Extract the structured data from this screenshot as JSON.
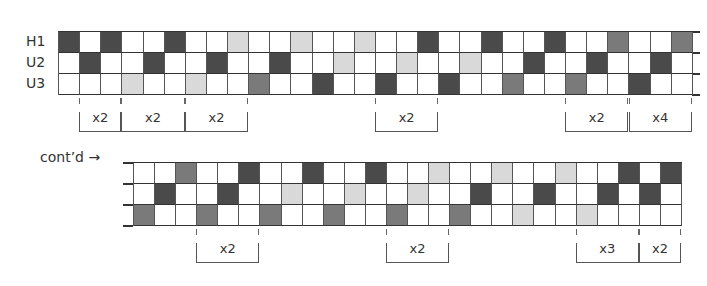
{
  "figure": {
    "row_labels": [
      "H1",
      "U2",
      "U3"
    ],
    "continued_label": "cont’d",
    "continued_arrow": "→",
    "legend_codes": {
      "0": "white",
      "1": "light gray",
      "2": "medium gray",
      "3": "dark gray"
    },
    "colors": {
      "white": "#ffffff",
      "light": "#d9d9d9",
      "medium": "#7a7a7a",
      "dark": "#4a4a4a"
    },
    "section1": {
      "columns": 30,
      "rows": [
        [
          3,
          0,
          3,
          0,
          0,
          3,
          0,
          0,
          1,
          0,
          0,
          1,
          0,
          0,
          1,
          0,
          0,
          3,
          0,
          0,
          3,
          0,
          0,
          3,
          0,
          0,
          2,
          0,
          0,
          2
        ],
        [
          0,
          3,
          0,
          0,
          3,
          0,
          0,
          3,
          0,
          0,
          3,
          0,
          0,
          1,
          0,
          0,
          1,
          0,
          0,
          1,
          0,
          0,
          3,
          0,
          0,
          3,
          0,
          0,
          3,
          0
        ],
        [
          0,
          0,
          0,
          1,
          0,
          0,
          1,
          0,
          0,
          2,
          0,
          0,
          3,
          0,
          0,
          3,
          0,
          0,
          3,
          0,
          0,
          2,
          0,
          0,
          2,
          0,
          0,
          3,
          0,
          0
        ]
      ],
      "brackets": [
        {
          "start_col": 1,
          "end_col": 3,
          "label": "x2"
        },
        {
          "start_col": 3,
          "end_col": 6,
          "label": "x2"
        },
        {
          "start_col": 6,
          "end_col": 9,
          "label": "x2"
        },
        {
          "start_col": 15,
          "end_col": 18,
          "label": "x2"
        },
        {
          "start_col": 24,
          "end_col": 27,
          "label": "x2"
        },
        {
          "start_col": 27,
          "end_col": 30,
          "label": "x4"
        }
      ]
    },
    "section2": {
      "columns": 26,
      "rows": [
        [
          0,
          0,
          2,
          0,
          0,
          3,
          0,
          0,
          3,
          0,
          0,
          3,
          0,
          0,
          1,
          0,
          0,
          1,
          0,
          0,
          1,
          0,
          0,
          3,
          0,
          3
        ],
        [
          0,
          3,
          0,
          0,
          3,
          0,
          0,
          1,
          0,
          0,
          1,
          0,
          0,
          1,
          0,
          0,
          3,
          0,
          0,
          3,
          0,
          0,
          3,
          0,
          3,
          0
        ],
        [
          2,
          0,
          0,
          2,
          0,
          0,
          2,
          0,
          0,
          2,
          0,
          0,
          2,
          0,
          0,
          2,
          0,
          0,
          1,
          0,
          0,
          1,
          0,
          0,
          0,
          0
        ]
      ],
      "brackets": [
        {
          "start_col": 3,
          "end_col": 6,
          "label": "x2"
        },
        {
          "start_col": 12,
          "end_col": 15,
          "label": "x2"
        },
        {
          "start_col": 21,
          "end_col": 24,
          "label": "x3"
        },
        {
          "start_col": 24,
          "end_col": 26,
          "label": "x2"
        }
      ]
    }
  }
}
